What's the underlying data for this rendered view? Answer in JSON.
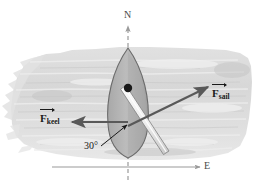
{
  "figure": {
    "compass": {
      "north_label": "N",
      "east_label": "E"
    },
    "forces": [
      {
        "id": "sail",
        "symbol": "F",
        "subscript": "sail",
        "direction_deg": 25,
        "color": "#595959"
      },
      {
        "id": "keel",
        "symbol": "F",
        "subscript": "keel",
        "direction_deg": 180,
        "color": "#595959"
      }
    ],
    "angle": {
      "value": "30",
      "unit": "°",
      "label": "30°"
    },
    "colors": {
      "water_wash": "#d8d8d8",
      "hull_fill": "#b5b5b5",
      "hull_stroke": "#6b6b6b",
      "boom_fill": "#f5f5f5",
      "boom_stroke": "#8a8a8a",
      "mast_dot": "#1a1a1a",
      "axis": "#8c8c8c",
      "arrow": "#595959",
      "text": "#1a1a1a"
    }
  }
}
